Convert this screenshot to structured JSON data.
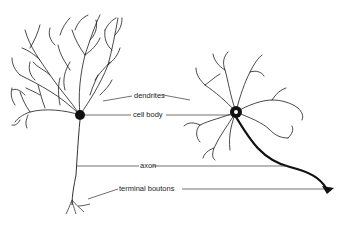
{
  "diagram": {
    "labels": {
      "dendrites": "dendrites",
      "cell_body": "cell body",
      "axon": "axon",
      "terminal_boutons": "terminal boutons"
    },
    "colors": {
      "ink": "#111111",
      "background": "#ffffff"
    }
  }
}
